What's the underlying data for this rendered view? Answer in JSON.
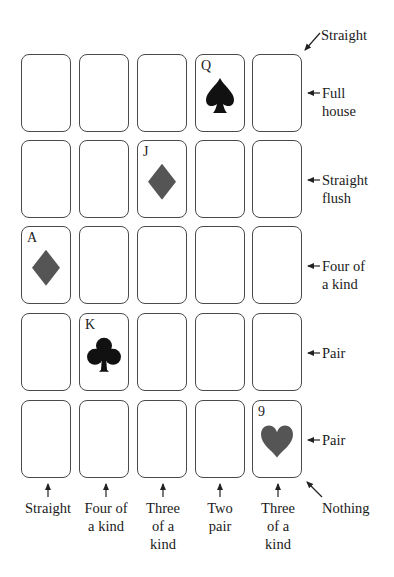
{
  "diagram": {
    "grid": {
      "rows": 5,
      "cols": 5,
      "face_up_cards": [
        {
          "row": 0,
          "col": 3,
          "rank": "Q",
          "suit": "spade",
          "color": "#111111"
        },
        {
          "row": 1,
          "col": 2,
          "rank": "J",
          "suit": "diamond",
          "color": "#555555"
        },
        {
          "row": 2,
          "col": 0,
          "rank": "A",
          "suit": "diamond",
          "color": "#555555"
        },
        {
          "row": 3,
          "col": 1,
          "rank": "K",
          "suit": "club",
          "color": "#111111"
        },
        {
          "row": 4,
          "col": 4,
          "rank": "9",
          "suit": "heart",
          "color": "#555555"
        }
      ]
    },
    "row_labels": [
      {
        "line1": "Full",
        "line2": "house"
      },
      {
        "line1": "Straight",
        "line2": "flush"
      },
      {
        "line1": "Four of",
        "line2": "a kind"
      },
      {
        "line1": "Pair",
        "line2": ""
      },
      {
        "line1": "Pair",
        "line2": ""
      }
    ],
    "column_labels": [
      {
        "lines": [
          "Straight"
        ]
      },
      {
        "lines": [
          "Four of",
          "a kind"
        ]
      },
      {
        "lines": [
          "Three",
          "of a",
          "kind"
        ]
      },
      {
        "lines": [
          "Two",
          "pair"
        ]
      },
      {
        "lines": [
          "Three",
          "of a",
          "kind"
        ]
      }
    ],
    "diagonal_labels": {
      "top_right": "Straight",
      "bottom_right": "Nothing"
    }
  }
}
